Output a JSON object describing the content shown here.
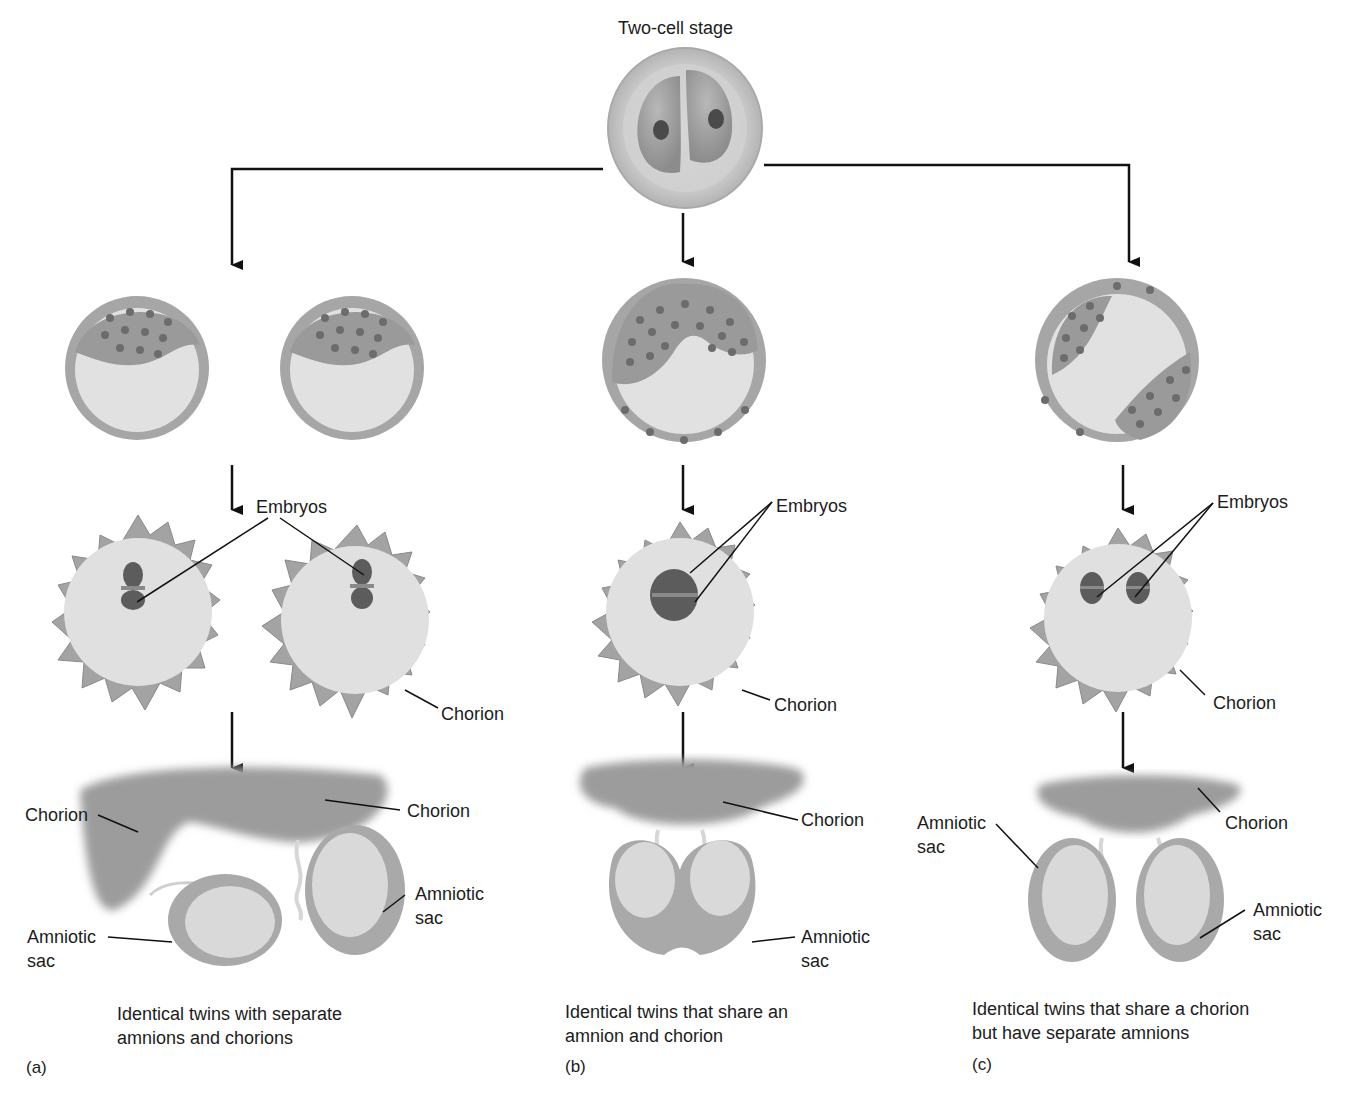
{
  "figure": {
    "title": "Two-cell stage",
    "colors": {
      "line": "#111111",
      "cell_fill": "#c9c9c9",
      "cell_dark": "#8f8f8f",
      "cavity": "#e2e2e2",
      "chorion": "#9d9d9d",
      "background": "#ffffff"
    },
    "panels": [
      {
        "id": "a",
        "letter": "(a)",
        "caption_line1": "Identical twins with separate",
        "caption_line2": "amnions and chorions",
        "stage2_label_embryos": "Embryos",
        "stage2_label_chorion": "Chorion",
        "stage3_label_chorion_left": "Chorion",
        "stage3_label_chorion_right": "Chorion",
        "stage3_label_amniotic_left_1": "Amniotic",
        "stage3_label_amniotic_left_2": "sac",
        "stage3_label_amniotic_right_1": "Amniotic",
        "stage3_label_amniotic_right_2": "sac"
      },
      {
        "id": "b",
        "letter": "(b)",
        "caption_line1": "Identical twins that share an",
        "caption_line2": "amnion and chorion",
        "stage2_label_embryos": "Embryos",
        "stage2_label_chorion": "Chorion",
        "stage3_label_chorion": "Chorion",
        "stage3_label_amniotic_1": "Amniotic",
        "stage3_label_amniotic_2": "sac"
      },
      {
        "id": "c",
        "letter": "(c)",
        "caption_line1": "Identical twins that share a chorion",
        "caption_line2": "but have separate amnions",
        "stage2_label_embryos": "Embryos",
        "stage2_label_chorion": "Chorion",
        "stage3_label_chorion": "Chorion",
        "stage3_label_amniotic_left_1": "Amniotic",
        "stage3_label_amniotic_left_2": "sac",
        "stage3_label_amniotic_right_1": "Amniotic",
        "stage3_label_amniotic_right_2": "sac"
      }
    ]
  }
}
